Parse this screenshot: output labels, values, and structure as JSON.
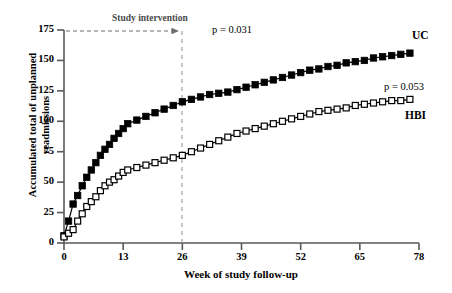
{
  "chart_data": {
    "type": "line",
    "title": "",
    "xlabel": "Week of study follow-up",
    "ylabel_line1": "Accumulated total of unplanned",
    "ylabel_line2": "readmissions",
    "xlim": [
      0,
      78
    ],
    "ylim": [
      0,
      175
    ],
    "xticks": [
      0,
      13,
      26,
      39,
      52,
      65,
      78
    ],
    "yticks": [
      0,
      25,
      50,
      75,
      100,
      125,
      150,
      175
    ],
    "grid": false,
    "legend_position": "right-inline",
    "annotations": {
      "intervention_label": "Study intervention",
      "intervention_arrow_from_week": 0,
      "intervention_arrow_to_week": 26,
      "intervention_line_week": 26,
      "p_top": "p = 0.031",
      "p_bottom": "p = 0.053"
    },
    "series": [
      {
        "name": "UC",
        "label": "UC",
        "marker": "filled-square",
        "color": "#000000",
        "x": [
          0,
          1,
          2,
          3,
          4,
          5,
          6,
          7,
          8,
          9,
          10,
          11,
          12,
          13,
          14,
          16,
          18,
          20,
          22,
          24,
          26,
          28,
          30,
          32,
          34,
          36,
          38,
          40,
          42,
          44,
          46,
          48,
          50,
          52,
          54,
          56,
          58,
          60,
          62,
          64,
          66,
          68,
          70,
          72,
          74,
          76
        ],
        "values": [
          6,
          18,
          32,
          39,
          47,
          54,
          60,
          66,
          72,
          77,
          81,
          86,
          90,
          94,
          98,
          101,
          104,
          107,
          110,
          113,
          116,
          118,
          120,
          122,
          123,
          124,
          126,
          128,
          130,
          132,
          134,
          136,
          138,
          140,
          142,
          143,
          145,
          146,
          148,
          149,
          150,
          152,
          153,
          154,
          155,
          156
        ]
      },
      {
        "name": "HBI",
        "label": "HBI",
        "marker": "open-square",
        "color": "#000000",
        "x": [
          0,
          1,
          2,
          3,
          4,
          5,
          6,
          7,
          8,
          9,
          10,
          11,
          12,
          13,
          14,
          16,
          18,
          20,
          22,
          24,
          26,
          28,
          30,
          32,
          34,
          36,
          38,
          40,
          42,
          44,
          46,
          48,
          50,
          52,
          54,
          56,
          58,
          60,
          62,
          64,
          66,
          68,
          70,
          72,
          74,
          76
        ],
        "values": [
          5,
          8,
          11,
          18,
          24,
          30,
          34,
          38,
          43,
          47,
          50,
          52,
          55,
          58,
          60,
          62,
          64,
          66,
          68,
          70,
          72,
          75,
          78,
          81,
          84,
          87,
          90,
          92,
          94,
          96,
          98,
          100,
          102,
          104,
          106,
          108,
          109,
          110,
          111,
          113,
          114,
          115,
          116,
          117,
          117,
          118
        ]
      }
    ]
  },
  "axis": {
    "ytick_labels": [
      "0",
      "25",
      "50",
      "75",
      "100",
      "125",
      "150",
      "175"
    ],
    "xtick_labels": [
      "0",
      "13",
      "26",
      "39",
      "52",
      "65",
      "78"
    ]
  },
  "colors": {
    "axis": "#595959",
    "series": "#000000",
    "annotation_gray": "#6e6e6e",
    "background": "#ffffff"
  }
}
